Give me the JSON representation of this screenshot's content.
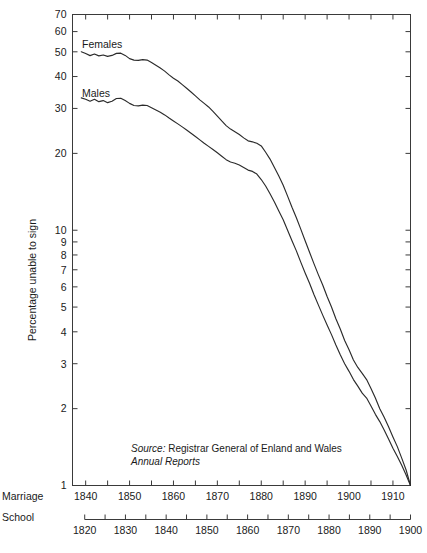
{
  "chart_data": {
    "type": "line",
    "title": "",
    "ylabel": "Percentage unable to sign",
    "yscale": "log",
    "ylim": [
      1,
      70
    ],
    "ytick_labels": [
      "70",
      "60",
      "50",
      "40",
      "30",
      "20",
      "10",
      "9",
      "8",
      "7",
      "6",
      "5",
      "4",
      "3",
      "2",
      "1"
    ],
    "ytick_values": [
      70,
      60,
      50,
      40,
      30,
      20,
      10,
      9,
      8,
      7,
      6,
      5,
      4,
      3,
      2,
      1
    ],
    "grid": false,
    "legend_position": "inline-labels",
    "axes": [
      {
        "name": "Marriage",
        "label": "Marriage",
        "xlim": [
          1837,
          1914
        ],
        "tick_labels": [
          "1840",
          "1850",
          "1860",
          "1870",
          "1880",
          "1890",
          "1900",
          "1910"
        ],
        "tick_values": [
          1840,
          1850,
          1860,
          1870,
          1880,
          1890,
          1900,
          1910
        ],
        "minor_step": 5
      },
      {
        "name": "School",
        "label": "School",
        "xlim": [
          1817,
          1900
        ],
        "tick_labels": [
          "1820",
          "1830",
          "1840",
          "1850",
          "1860",
          "1870",
          "1880",
          "1890",
          "1900"
        ],
        "tick_values": [
          1820,
          1830,
          1840,
          1850,
          1860,
          1870,
          1880,
          1890,
          1900
        ],
        "minor_step": 5
      }
    ],
    "annotations": [
      {
        "name": "source-note-line1-italic",
        "text": "Source:"
      },
      {
        "name": "source-note-line1-regular",
        "text": " Registrar General of Enland and Wales"
      },
      {
        "name": "source-note-line2-italic",
        "text": "Annual Reports"
      }
    ],
    "series": [
      {
        "name": "Females",
        "label": "Females",
        "color": "#2b2b2b",
        "points": [
          [
            1839,
            50.0
          ],
          [
            1840,
            49.2
          ],
          [
            1841,
            48.3
          ],
          [
            1842,
            49.0
          ],
          [
            1843,
            48.2
          ],
          [
            1844,
            48.6
          ],
          [
            1845,
            48.0
          ],
          [
            1846,
            48.4
          ],
          [
            1847,
            49.3
          ],
          [
            1848,
            49.4
          ],
          [
            1849,
            48.4
          ],
          [
            1850,
            47.0
          ],
          [
            1851,
            46.4
          ],
          [
            1852,
            46.3
          ],
          [
            1853,
            46.6
          ],
          [
            1854,
            46.4
          ],
          [
            1855,
            45.4
          ],
          [
            1856,
            44.3
          ],
          [
            1857,
            43.2
          ],
          [
            1858,
            42.0
          ],
          [
            1859,
            40.6
          ],
          [
            1860,
            39.4
          ],
          [
            1861,
            38.4
          ],
          [
            1862,
            37.2
          ],
          [
            1863,
            36.0
          ],
          [
            1864,
            34.8
          ],
          [
            1865,
            33.6
          ],
          [
            1866,
            32.4
          ],
          [
            1867,
            31.4
          ],
          [
            1868,
            30.4
          ],
          [
            1869,
            29.2
          ],
          [
            1870,
            28.0
          ],
          [
            1871,
            26.8
          ],
          [
            1872,
            25.7
          ],
          [
            1873,
            24.9
          ],
          [
            1874,
            24.3
          ],
          [
            1875,
            23.7
          ],
          [
            1876,
            23.0
          ],
          [
            1877,
            22.4
          ],
          [
            1878,
            22.2
          ],
          [
            1879,
            21.9
          ],
          [
            1880,
            21.4
          ],
          [
            1881,
            20.2
          ],
          [
            1882,
            19.0
          ],
          [
            1883,
            17.6
          ],
          [
            1884,
            16.3
          ],
          [
            1885,
            15.0
          ],
          [
            1886,
            13.6
          ],
          [
            1887,
            12.3
          ],
          [
            1888,
            11.2
          ],
          [
            1889,
            10.1
          ],
          [
            1890,
            9.1
          ],
          [
            1891,
            8.2
          ],
          [
            1892,
            7.4
          ],
          [
            1893,
            6.7
          ],
          [
            1894,
            6.1
          ],
          [
            1895,
            5.5
          ],
          [
            1896,
            5.0
          ],
          [
            1897,
            4.5
          ],
          [
            1898,
            4.1
          ],
          [
            1899,
            3.7
          ],
          [
            1900,
            3.4
          ],
          [
            1901,
            3.1
          ],
          [
            1902,
            2.9
          ],
          [
            1903,
            2.75
          ],
          [
            1904,
            2.6
          ],
          [
            1905,
            2.4
          ],
          [
            1906,
            2.2
          ],
          [
            1907,
            2.0
          ],
          [
            1908,
            1.85
          ],
          [
            1909,
            1.7
          ],
          [
            1910,
            1.55
          ],
          [
            1911,
            1.42
          ],
          [
            1912,
            1.28
          ],
          [
            1913,
            1.15
          ],
          [
            1914,
            1.0
          ]
        ]
      },
      {
        "name": "Males",
        "label": "Males",
        "color": "#2b2b2b",
        "points": [
          [
            1839,
            33.0
          ],
          [
            1840,
            32.6
          ],
          [
            1841,
            32.0
          ],
          [
            1842,
            32.6
          ],
          [
            1843,
            31.9
          ],
          [
            1844,
            32.2
          ],
          [
            1845,
            31.6
          ],
          [
            1846,
            32.0
          ],
          [
            1847,
            32.8
          ],
          [
            1848,
            32.9
          ],
          [
            1849,
            32.2
          ],
          [
            1850,
            31.4
          ],
          [
            1851,
            30.8
          ],
          [
            1852,
            30.7
          ],
          [
            1853,
            30.9
          ],
          [
            1854,
            30.8
          ],
          [
            1855,
            30.2
          ],
          [
            1856,
            29.6
          ],
          [
            1857,
            29.0
          ],
          [
            1858,
            28.3
          ],
          [
            1859,
            27.5
          ],
          [
            1860,
            26.8
          ],
          [
            1861,
            26.1
          ],
          [
            1862,
            25.4
          ],
          [
            1863,
            24.7
          ],
          [
            1864,
            24.0
          ],
          [
            1865,
            23.3
          ],
          [
            1866,
            22.6
          ],
          [
            1867,
            21.9
          ],
          [
            1868,
            21.3
          ],
          [
            1869,
            20.7
          ],
          [
            1870,
            20.1
          ],
          [
            1871,
            19.5
          ],
          [
            1872,
            18.9
          ],
          [
            1873,
            18.5
          ],
          [
            1874,
            18.3
          ],
          [
            1875,
            18.0
          ],
          [
            1876,
            17.6
          ],
          [
            1877,
            17.2
          ],
          [
            1878,
            17.0
          ],
          [
            1879,
            16.6
          ],
          [
            1880,
            15.8
          ],
          [
            1881,
            14.9
          ],
          [
            1882,
            13.9
          ],
          [
            1883,
            12.9
          ],
          [
            1884,
            11.9
          ],
          [
            1885,
            11.0
          ],
          [
            1886,
            10.0
          ],
          [
            1887,
            9.1
          ],
          [
            1888,
            8.3
          ],
          [
            1889,
            7.5
          ],
          [
            1890,
            6.8
          ],
          [
            1891,
            6.2
          ],
          [
            1892,
            5.6
          ],
          [
            1893,
            5.1
          ],
          [
            1894,
            4.65
          ],
          [
            1895,
            4.25
          ],
          [
            1896,
            3.9
          ],
          [
            1897,
            3.55
          ],
          [
            1898,
            3.25
          ],
          [
            1899,
            3.0
          ],
          [
            1900,
            2.8
          ],
          [
            1901,
            2.6
          ],
          [
            1902,
            2.45
          ],
          [
            1903,
            2.3
          ],
          [
            1904,
            2.2
          ],
          [
            1905,
            2.05
          ],
          [
            1906,
            1.9
          ],
          [
            1907,
            1.78
          ],
          [
            1908,
            1.65
          ],
          [
            1909,
            1.52
          ],
          [
            1910,
            1.4
          ],
          [
            1911,
            1.3
          ],
          [
            1912,
            1.2
          ],
          [
            1913,
            1.1
          ],
          [
            1914,
            1.0
          ]
        ]
      }
    ]
  }
}
